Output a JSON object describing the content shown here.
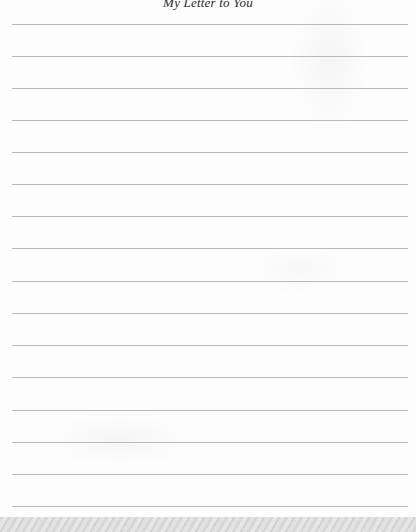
{
  "letter": {
    "title": "My Letter to You",
    "line_count": 16,
    "line_positions_y": [
      24,
      56,
      88,
      120,
      152,
      184,
      216,
      248,
      281,
      313,
      345,
      377,
      410,
      442,
      474,
      506
    ],
    "line_color": "#b9b9b9",
    "paper_color": "#fdfdfd",
    "lines_text": [
      "",
      "",
      "",
      "",
      "",
      "",
      "",
      "",
      "",
      "",
      "",
      "",
      "",
      "",
      "",
      ""
    ]
  }
}
